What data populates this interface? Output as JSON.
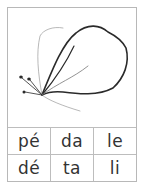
{
  "card": {
    "illustration": "hibiscus-flower-sketch",
    "syllables": [
      [
        "pé",
        "da",
        "le"
      ],
      [
        "dé",
        "ta",
        "li"
      ]
    ]
  },
  "colors": {
    "border": "#bdbdbd",
    "text": "#333333",
    "ink": "#2a2a2a"
  }
}
